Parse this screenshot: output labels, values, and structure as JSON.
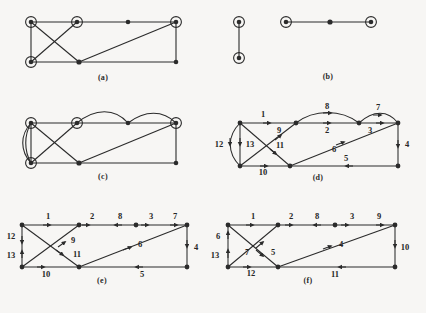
{
  "figure": {
    "background": "#f7f6f4",
    "ink": "#2b2b2b",
    "width": 426,
    "height": 313,
    "panel_count": 6
  },
  "panels": [
    {
      "id": "a",
      "caption": "(a)",
      "type": "undirected-graph",
      "description": "Rectangular graph with two crossing diagonals and one long diagonal; four nodes are highlighted with concentric rings.",
      "node_count": 6,
      "ringed_node_count": 4,
      "edge_count": 8,
      "edge_labels": []
    },
    {
      "id": "b",
      "caption": "(b)",
      "type": "undirected-graph",
      "description": "Two disjoint components: a vertical edge between two ringed nodes, and a horizontal path of three nodes with ringed endpoints.",
      "node_count": 5,
      "ringed_node_count": 4,
      "edge_count": 3,
      "edge_labels": []
    },
    {
      "id": "c",
      "caption": "(c)",
      "type": "multigraph",
      "description": "Same skeleton as panel (a) with added curved parallel edges on the left side and two arcs along the top.",
      "node_count": 6,
      "ringed_node_count": 4,
      "edge_count": 11,
      "edge_labels": []
    },
    {
      "id": "d",
      "caption": "(d)",
      "type": "directed-multigraph",
      "description": "Directed version of panel (c) with thirteen numbered arcs.",
      "node_count": 6,
      "edge_count": 13,
      "edge_labels": [
        "1",
        "2",
        "3",
        "4",
        "5",
        "6",
        "7",
        "8",
        "9",
        "10",
        "11",
        "12",
        "13"
      ]
    },
    {
      "id": "e",
      "caption": "(e)",
      "type": "directed-graph",
      "description": "Directed rectangular graph with crossing diagonals and thirteen numbered arcs.",
      "node_count": 8,
      "edge_count": 13,
      "edge_labels": [
        "1",
        "2",
        "8",
        "3",
        "7",
        "12",
        "13",
        "9",
        "11",
        "10",
        "6",
        "5",
        "4"
      ]
    },
    {
      "id": "f",
      "caption": "(f)",
      "type": "directed-graph",
      "description": "Directed rectangular graph variant with crossing diagonals and thirteen numbered arcs.",
      "node_count": 8,
      "edge_count": 13,
      "edge_labels": [
        "1",
        "2",
        "8",
        "3",
        "9",
        "6",
        "13",
        "7",
        "5",
        "12",
        "11",
        "4",
        "10"
      ]
    }
  ],
  "panel_a": {
    "caption": "(a)"
  },
  "panel_b": {
    "caption": "(b)"
  },
  "panel_c": {
    "caption": "(c)"
  },
  "panel_d": {
    "caption": "(d)",
    "labels": {
      "top_left": "1",
      "top_mid_arc": "8",
      "top_mid_straight": "2",
      "top_right_arc": "7",
      "upper_right_diag": "3",
      "right_side": "4",
      "bottom_right": "5",
      "long_diag": "6",
      "short_diag": "9",
      "bottom_left": "10",
      "cross_diag": "11",
      "left_curve": "12",
      "left_straight": "13"
    }
  },
  "panel_e": {
    "caption": "(e)",
    "labels": {
      "top_1": "1",
      "top_2": "2",
      "top_3": "8",
      "top_4": "3",
      "top_5": "7",
      "left_upper": "12",
      "left_lower": "13",
      "diag_up": "9",
      "diag_down": "11",
      "bottom_left": "10",
      "long_diag": "6",
      "bottom_right": "5",
      "right_side": "4"
    }
  },
  "panel_f": {
    "caption": "(f)",
    "labels": {
      "top_1": "1",
      "top_2": "2",
      "top_3": "8",
      "top_4": "3",
      "top_5": "9",
      "left_upper": "6",
      "left_lower": "13",
      "diag_up": "7",
      "diag_down": "5",
      "bottom_left": "12",
      "long_diag": "4",
      "bottom_mid": "11",
      "right_side": "10"
    }
  }
}
